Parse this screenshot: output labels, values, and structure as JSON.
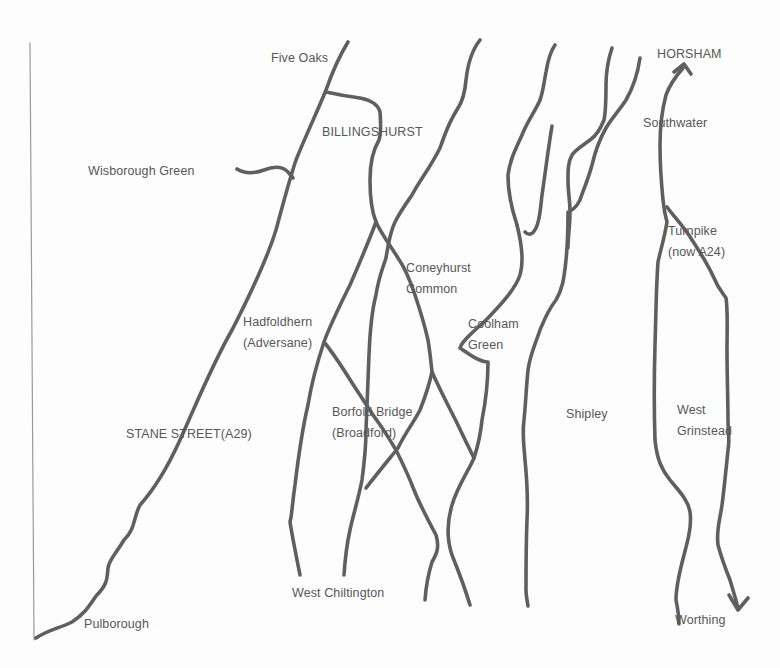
{
  "map": {
    "type": "hand-drawn road sketch map",
    "colors": {
      "road": "#5f5f5f",
      "label": "#575757",
      "background": "#fdfdfd",
      "border": "#9a9a9a"
    },
    "places": {
      "five_oaks": {
        "lines": [
          "Five Oaks"
        ]
      },
      "billingshurst": {
        "lines": [
          "BILLINGSHURST"
        ]
      },
      "wisborough_green": {
        "lines": [
          "Wisborough Green"
        ]
      },
      "horsham": {
        "lines": [
          "HORSHAM"
        ]
      },
      "southwater": {
        "lines": [
          "Southwater"
        ]
      },
      "turnpike": {
        "lines": [
          "Turnpike",
          "(now A24)"
        ]
      },
      "coneyhurst_common": {
        "lines": [
          "Coneyhurst",
          "Common"
        ]
      },
      "hadfoldhern": {
        "lines": [
          "Hadfoldhern",
          "(Adversane)"
        ]
      },
      "coolham_green": {
        "lines": [
          "Coolham",
          "Green"
        ]
      },
      "borfold_bridge": {
        "lines": [
          "Borfold Bridge",
          "(Broadford)"
        ]
      },
      "stane_street": {
        "lines": [
          "STANE STREET(A29)"
        ]
      },
      "shipley": {
        "lines": [
          "Shipley"
        ]
      },
      "west_grinstead": {
        "lines": [
          "West",
          "Grinstead"
        ]
      },
      "west_chiltington": {
        "lines": [
          "West Chiltington"
        ]
      },
      "pulborough": {
        "lines": [
          "Pulborough"
        ]
      },
      "worthing": {
        "lines": [
          "Worthing"
        ]
      }
    },
    "arrows": [
      {
        "name": "arrow-to-horsham",
        "direction": "north"
      },
      {
        "name": "arrow-to-worthing",
        "direction": "south"
      }
    ]
  }
}
